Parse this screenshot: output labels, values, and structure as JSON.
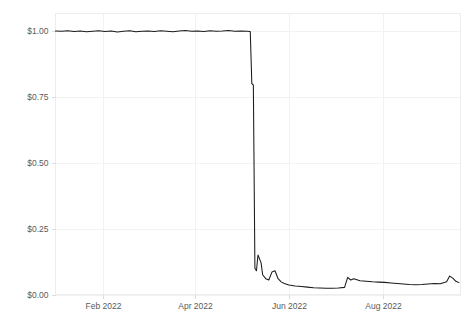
{
  "chart_data": {
    "type": "line",
    "title": "",
    "subtitle": "",
    "xlabel": "",
    "ylabel": "",
    "grid": true,
    "legend": false,
    "legend_position": "none",
    "line_color": "#1a1a1a",
    "grid_color": "#f2f2f2",
    "axis_label_color": "#5a5a5a",
    "background_color": "#ffffff",
    "ylim": [
      0,
      1.05
    ],
    "xlim": [
      "2022-01-01",
      "2022-09-20"
    ],
    "ytick_labels": [
      "$1.00",
      "$0.75",
      "$0.50",
      "$0.25",
      "$0.00"
    ],
    "ytick_values": [
      1.0,
      0.75,
      0.5,
      0.25,
      0.0
    ],
    "xtick_labels": [
      "Feb 2022",
      "Apr 2022",
      "Jun 2022",
      "Aug 2022"
    ],
    "xtick_values": [
      "2022-02-01",
      "2022-04-01",
      "2022-06-01",
      "2022-08-01"
    ],
    "series": [
      {
        "name": "price",
        "color": "#1a1a1a",
        "x": [
          "2022-01-01",
          "2022-01-05",
          "2022-01-09",
          "2022-01-13",
          "2022-01-17",
          "2022-01-21",
          "2022-01-25",
          "2022-01-29",
          "2022-02-02",
          "2022-02-06",
          "2022-02-10",
          "2022-02-14",
          "2022-02-18",
          "2022-02-22",
          "2022-02-26",
          "2022-03-02",
          "2022-03-06",
          "2022-03-10",
          "2022-03-14",
          "2022-03-18",
          "2022-03-22",
          "2022-03-26",
          "2022-03-30",
          "2022-04-03",
          "2022-04-07",
          "2022-04-11",
          "2022-04-15",
          "2022-04-19",
          "2022-04-23",
          "2022-04-27",
          "2022-05-01",
          "2022-05-05",
          "2022-05-07",
          "2022-05-08",
          "2022-05-09",
          "2022-05-10",
          "2022-05-11",
          "2022-05-12",
          "2022-05-13",
          "2022-05-14",
          "2022-05-15",
          "2022-05-17",
          "2022-05-19",
          "2022-05-21",
          "2022-05-23",
          "2022-05-25",
          "2022-05-27",
          "2022-05-29",
          "2022-06-01",
          "2022-06-05",
          "2022-06-09",
          "2022-06-13",
          "2022-06-17",
          "2022-06-21",
          "2022-06-25",
          "2022-06-29",
          "2022-07-03",
          "2022-07-07",
          "2022-07-09",
          "2022-07-11",
          "2022-07-13",
          "2022-07-17",
          "2022-07-21",
          "2022-07-25",
          "2022-07-29",
          "2022-08-02",
          "2022-08-06",
          "2022-08-10",
          "2022-08-14",
          "2022-08-18",
          "2022-08-22",
          "2022-08-26",
          "2022-08-30",
          "2022-09-03",
          "2022-09-07",
          "2022-09-09",
          "2022-09-11",
          "2022-09-13",
          "2022-09-15",
          "2022-09-17",
          "2022-09-19"
        ],
        "values": [
          1.0,
          0.999,
          1.001,
          0.998,
          1.0,
          0.997,
          0.999,
          1.001,
          0.998,
          1.0,
          0.996,
          0.999,
          1.001,
          0.997,
          0.999,
          1.0,
          0.998,
          1.001,
          0.999,
          0.997,
          1.0,
          1.002,
          0.999,
          1.0,
          0.998,
          1.001,
          0.999,
          1.0,
          1.002,
          0.999,
          1.0,
          0.999,
          0.998,
          0.8,
          0.795,
          0.1,
          0.09,
          0.15,
          0.135,
          0.12,
          0.075,
          0.06,
          0.055,
          0.085,
          0.09,
          0.06,
          0.048,
          0.042,
          0.036,
          0.032,
          0.03,
          0.028,
          0.026,
          0.025,
          0.024,
          0.024,
          0.025,
          0.027,
          0.065,
          0.055,
          0.06,
          0.052,
          0.05,
          0.048,
          0.047,
          0.046,
          0.044,
          0.042,
          0.04,
          0.038,
          0.037,
          0.038,
          0.04,
          0.042,
          0.041,
          0.045,
          0.048,
          0.07,
          0.062,
          0.05,
          0.045
        ]
      }
    ]
  },
  "caption": {
    "text": ""
  }
}
